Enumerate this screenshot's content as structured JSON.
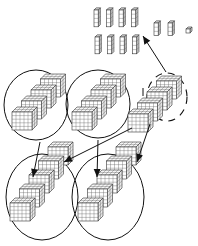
{
  "diagram": {
    "top_columns": {
      "rows": 2,
      "columns_per_row": 4,
      "cubes_per_column": 4
    },
    "small_columns": {
      "count": 2,
      "cubes_per_column": 3
    },
    "single_cube": {
      "count": 1
    },
    "middle_groups": [
      {
        "id": "group-a",
        "outline": "solid",
        "blocks": 4
      },
      {
        "id": "group-b",
        "outline": "solid",
        "blocks": 4
      },
      {
        "id": "group-c",
        "outline": "dashed",
        "blocks": 4
      }
    ],
    "bottom_groups": [
      {
        "id": "group-d",
        "outline": "solid",
        "blocks": 5
      },
      {
        "id": "group-e",
        "outline": "solid",
        "blocks": 5
      }
    ],
    "arrows": [
      {
        "from": "group-c",
        "to": "top_columns"
      },
      {
        "from": "group-a",
        "to": "group-d"
      },
      {
        "from": "group-c",
        "to": "group-d"
      },
      {
        "from": "group-b",
        "to": "group-e"
      },
      {
        "from": "group-c",
        "to": "group-e"
      }
    ],
    "colors": {
      "line": "#111111",
      "background": "#ffffff"
    }
  }
}
